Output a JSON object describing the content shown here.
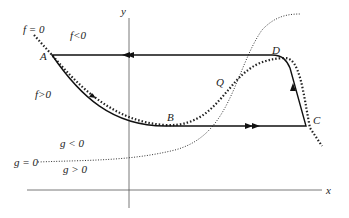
{
  "diagram": {
    "axes": {
      "x_label": "x",
      "y_label": "y"
    },
    "points": {
      "A": "A",
      "B": "B",
      "C": "C",
      "D": "D",
      "Q": "Q"
    },
    "regions": {
      "f_zero": "f = 0",
      "f_neg": "f<0",
      "f_pos": "f>0",
      "g_zero": "g = 0",
      "g_neg": "g < 0",
      "g_pos": "g > 0"
    },
    "colors": {
      "curve": "#111111",
      "axis": "#555555",
      "background": "#ffffff"
    }
  }
}
